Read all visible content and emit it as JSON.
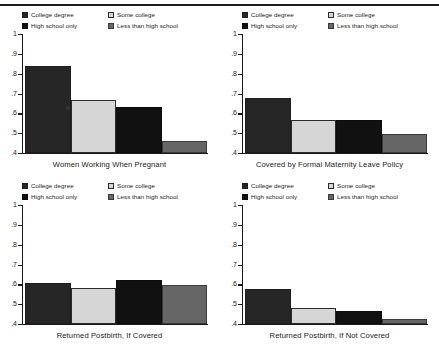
{
  "figure": {
    "has_top_rule": true,
    "y_axis": {
      "min": 0.4,
      "max": 1.0,
      "ticks": [
        {
          "value": 1.0,
          "label": "1"
        },
        {
          "value": 0.9,
          "label": ".9"
        },
        {
          "value": 0.8,
          "label": ".8"
        },
        {
          "value": 0.7,
          "label": ".7"
        },
        {
          "value": 0.6,
          "label": ".6"
        },
        {
          "value": 0.5,
          "label": ".5"
        },
        {
          "value": 0.4,
          "label": ".4"
        }
      ]
    },
    "legend": {
      "left_column": [
        {
          "label": "College degree",
          "color": "#262626"
        },
        {
          "label": "High school only",
          "color": "#111111"
        }
      ],
      "right_column": [
        {
          "label": "Some college",
          "color": "#d6d6d6"
        },
        {
          "label": "Less than high school",
          "color": "#666666"
        }
      ]
    }
  },
  "chart_data": [
    {
      "type": "bar",
      "title": "Women Working When Pregnant",
      "categories": [
        "College degree",
        "Some college",
        "High school only",
        "Less than high school"
      ],
      "values": [
        0.84,
        0.665,
        0.63,
        0.46
      ],
      "colors": [
        "#262626",
        "#d6d6d6",
        "#111111",
        "#666666"
      ],
      "xlabel": "",
      "ylabel": "",
      "ylim": [
        0.4,
        1.0
      ],
      "grid": false,
      "legend_position": "top"
    },
    {
      "type": "bar",
      "title": "Covered by Formal Maternity Leave Policy",
      "categories": [
        "College degree",
        "Some college",
        "High school only",
        "Less than high school"
      ],
      "values": [
        0.675,
        0.565,
        0.565,
        0.495
      ],
      "colors": [
        "#262626",
        "#d6d6d6",
        "#111111",
        "#666666"
      ],
      "xlabel": "",
      "ylabel": "",
      "ylim": [
        0.4,
        1.0
      ],
      "grid": false,
      "legend_position": "top"
    },
    {
      "type": "bar",
      "title": "Returned Postbirth, If Covered",
      "categories": [
        "College degree",
        "Some college",
        "High school only",
        "Less than high school"
      ],
      "values": [
        0.608,
        0.583,
        0.622,
        0.597
      ],
      "colors": [
        "#262626",
        "#d6d6d6",
        "#111111",
        "#666666"
      ],
      "xlabel": "",
      "ylabel": "",
      "ylim": [
        0.4,
        1.0
      ],
      "grid": false,
      "legend_position": "top"
    },
    {
      "type": "bar",
      "title": "Returned Postbirth, If Not Covered",
      "categories": [
        "College degree",
        "Some college",
        "High school only",
        "Less than high school"
      ],
      "values": [
        0.578,
        0.48,
        0.465,
        0.425
      ],
      "colors": [
        "#262626",
        "#d6d6d6",
        "#111111",
        "#666666"
      ],
      "xlabel": "",
      "ylabel": "",
      "ylim": [
        0.4,
        1.0
      ],
      "grid": false,
      "legend_position": "top"
    }
  ]
}
